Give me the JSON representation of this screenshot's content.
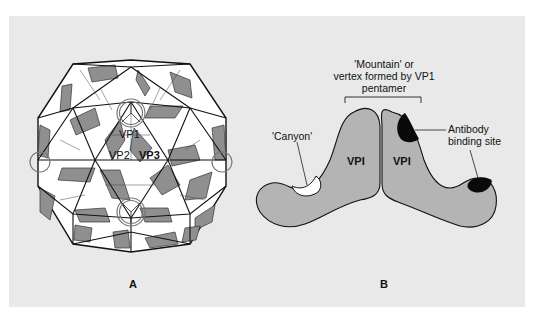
{
  "figure": {
    "panel_a": {
      "letter": "A",
      "subject": "icosahedral virus capsid",
      "labels": {
        "vp1": "VP1",
        "vp2": "VP2",
        "vp3": "VP3"
      }
    },
    "panel_b": {
      "letter": "B",
      "mountain_label": [
        "'Mountain' or",
        "vertex formed by VP1",
        "pentamer"
      ],
      "canyon_label": "'Canyon'",
      "antibody_label": [
        "Antibody",
        "binding site"
      ],
      "subunit_left": "VPI",
      "subunit_right": "VPI"
    },
    "colors": {
      "background": "#e9e9e9",
      "capsid_gray": "#8f8f8f",
      "subunit_gray": "#b4b4b4",
      "antibody_site": "#0a0a0a",
      "canyon": "#ffffff"
    }
  }
}
